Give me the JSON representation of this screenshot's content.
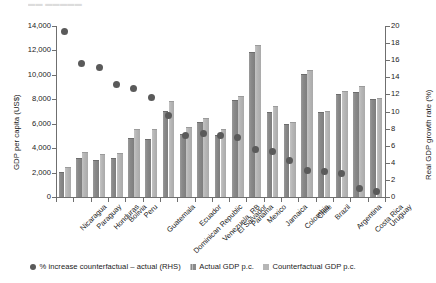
{
  "figure": {
    "header_remnant": "▬▬ ▬▬▬▬▬",
    "left_axis_title": "GDP per capita (US$)",
    "right_axis_title": "Real GDP growth rate (%)",
    "left_ticks": [
      "14,000",
      "12,000",
      "10,000",
      "8,000",
      "6,000",
      "4,000",
      "2,000",
      "0"
    ],
    "right_ticks": [
      "20",
      "18",
      "16",
      "14",
      "12",
      "10",
      "8",
      "6",
      "4",
      "2",
      "0"
    ]
  },
  "legend": {
    "items": [
      {
        "marker": "circle-marker",
        "label": "% increase counterfactual – actual (RHS)"
      },
      {
        "marker": "square-marker-dark",
        "label": "Actual GDP p.c."
      },
      {
        "marker": "square-marker-light",
        "label": "Counterfactual GDP p.c."
      }
    ]
  },
  "chart_data": {
    "type": "bar",
    "title": "",
    "xlabel": "",
    "ylabel": "GDP per capita (US$)",
    "y2label": "Real GDP growth rate (%)",
    "ylim": [
      0,
      14000
    ],
    "y2lim": [
      0,
      20
    ],
    "ytick_step": 2000,
    "y2tick_step": 2,
    "grid": false,
    "legend_position": "bottom",
    "categories": [
      "Nicaragua",
      "Paraguay",
      "Honduras",
      "Bolivia",
      "Peru",
      "Guatemala",
      "Dominican Republic",
      "Ecuador",
      "Venezuela, RB",
      "El Salvador",
      "Panama",
      "Mexico",
      "Jamaica",
      "Colombia",
      "Chile",
      "Brazil",
      "Argentina",
      "Costa Rica",
      "Uruguay"
    ],
    "series": [
      {
        "name": "Actual GDP p.c.",
        "axis": "left",
        "color": "#8a8a8a",
        "values": [
          2060,
          3170,
          3050,
          3160,
          4830,
          4740,
          7060,
          5160,
          6180,
          5040,
          7960,
          11900,
          6970,
          5950,
          10050,
          6930,
          8450,
          8610,
          8000
        ]
      },
      {
        "name": "Counterfactual GDP p.c.",
        "axis": "left",
        "color": "#b6b6b6",
        "values": [
          2480,
          3690,
          3520,
          3640,
          5600,
          5550,
          7900,
          5710,
          6460,
          5600,
          8300,
          12430,
          7420,
          6180,
          10430,
          7030,
          8670,
          9100,
          8120
        ]
      },
      {
        "name": "% increase counterfactual – actual (RHS)",
        "axis": "right",
        "type": "scatter",
        "color": "#5a5a5a",
        "values": [
          19.3,
          15.6,
          15.1,
          13.2,
          12.7,
          11.6,
          9.5,
          7.2,
          7.4,
          7.2,
          7.0,
          5.5,
          5.3,
          4.3,
          3.1,
          3.0,
          2.7,
          1.0,
          0.6
        ]
      }
    ]
  }
}
